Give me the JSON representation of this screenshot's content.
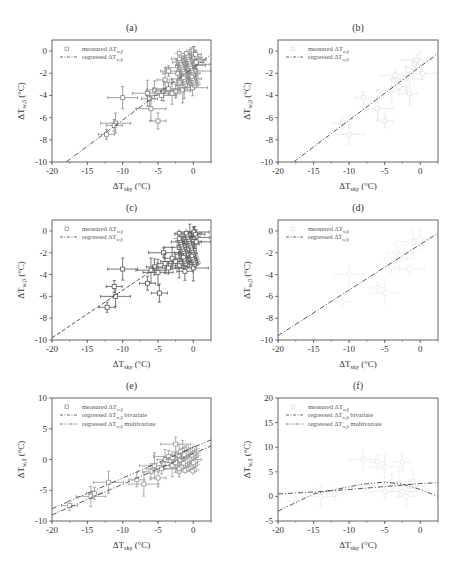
{
  "figure": {
    "panels": [
      "a",
      "b",
      "c",
      "d",
      "e",
      "f"
    ]
  },
  "chart_data": [
    {
      "id": "a",
      "title": "(a)",
      "type": "scatter",
      "xlabel": "ΔT_sky (°C)",
      "ylabel": "ΔT_w,β (°C)",
      "xlim": [
        -20,
        2.5
      ],
      "ylim": [
        -10,
        1
      ],
      "xticks": [
        -20,
        -15,
        -10,
        -5,
        0
      ],
      "yticks": [
        0,
        -2,
        -4,
        -6,
        -8,
        -10
      ],
      "legend": [
        "measured ΔT_w,β",
        "regressed ΔT_w,β"
      ],
      "legend_position": "upper-left",
      "points_visible": true,
      "point_color": "#888888",
      "points": [
        [
          -12.3,
          -7.5
        ],
        [
          -11,
          -6.5
        ],
        [
          -11.2,
          -6.7
        ],
        [
          -10,
          -4.2
        ],
        [
          -6.2,
          -4.3
        ],
        [
          -6,
          -5.2
        ],
        [
          -5,
          -6.3
        ],
        [
          -6.5,
          -3.8
        ],
        [
          -5.5,
          -3.5
        ],
        [
          -4.5,
          -4
        ],
        [
          -4.2,
          -3.6
        ],
        [
          -3.5,
          -3.4
        ],
        [
          -3,
          -3.8
        ],
        [
          -2.5,
          -3.6
        ],
        [
          -4,
          -2.6
        ],
        [
          -2,
          -2.8
        ],
        [
          -1.5,
          -3.5
        ],
        [
          -1,
          -2.5
        ],
        [
          -0.5,
          -2.2
        ],
        [
          -1.8,
          -1.5
        ],
        [
          -1.2,
          -1.2
        ],
        [
          -0.8,
          -1
        ],
        [
          -0.5,
          -0.5
        ],
        [
          -0.3,
          -0.8
        ],
        [
          0,
          -0.3
        ],
        [
          0.2,
          -1.2
        ],
        [
          -0.2,
          -2
        ],
        [
          0.3,
          -1.8
        ],
        [
          -0.6,
          -1.6
        ],
        [
          -1,
          -0.7
        ],
        [
          0.1,
          -0.6
        ],
        [
          -0.4,
          -1.3
        ],
        [
          0.4,
          -1
        ],
        [
          -0.1,
          -3.3
        ],
        [
          -1.3,
          -3.1
        ],
        [
          -2.2,
          -2
        ],
        [
          -3.5,
          -1.8
        ]
      ],
      "regression": {
        "style": "dash-dot",
        "x": [
          -18,
          2.5
        ],
        "y": [
          -10,
          -0.3
        ]
      }
    },
    {
      "id": "b",
      "title": "(b)",
      "type": "scatter",
      "xlabel": "ΔT_sky (°C)",
      "ylabel": "ΔT_w,β (°C)",
      "xlim": [
        -20,
        2.5
      ],
      "ylim": [
        -10,
        1
      ],
      "xticks": [
        -20,
        -15,
        -10,
        -5,
        0
      ],
      "yticks": [
        0,
        -2,
        -4,
        -6,
        -8,
        -10
      ],
      "legend": [
        "measured ΔT_w,β",
        "regressed ΔT_w,β"
      ],
      "legend_position": "upper-left",
      "points_visible": true,
      "point_color": "#e6e6e6",
      "points": [
        [
          -11,
          -6.5
        ],
        [
          -10,
          -7.5
        ],
        [
          -8,
          -4.2
        ],
        [
          -6,
          -5.2
        ],
        [
          -5,
          -6.3
        ],
        [
          -4,
          -3.5
        ],
        [
          -3,
          -3.2
        ],
        [
          -2,
          -2.5
        ],
        [
          -1,
          -1.5
        ],
        [
          -0.5,
          -0.8
        ],
        [
          0,
          -1
        ],
        [
          0.3,
          -2
        ],
        [
          -1.5,
          -3.8
        ],
        [
          -3.5,
          -2.2
        ]
      ],
      "regression": {
        "style": "dash-dot",
        "x": [
          -17.8,
          2.5
        ],
        "y": [
          -10,
          -0.2
        ]
      }
    },
    {
      "id": "c",
      "title": "(c)",
      "type": "scatter",
      "xlabel": "ΔT_sky (°C)",
      "ylabel": "ΔT_w,β (°C)",
      "xlim": [
        -20,
        2.5
      ],
      "ylim": [
        -10,
        1
      ],
      "xticks": [
        -20,
        -15,
        -10,
        -5,
        0
      ],
      "yticks": [
        0,
        -2,
        -4,
        -6,
        -8,
        -10
      ],
      "legend": [
        "measured ΔT_w,β",
        "regressed ΔT_w,β"
      ],
      "legend_position": "upper-left",
      "points_visible": true,
      "point_color": "#555555",
      "points": [
        [
          -12.2,
          -7
        ],
        [
          -11,
          -6
        ],
        [
          -11.2,
          -5.1
        ],
        [
          -10,
          -3.5
        ],
        [
          -6.5,
          -4.8
        ],
        [
          -6,
          -3.6
        ],
        [
          -5.5,
          -3.3
        ],
        [
          -5,
          -3.8
        ],
        [
          -4.8,
          -5.7
        ],
        [
          -4.2,
          -2
        ],
        [
          -4,
          -3
        ],
        [
          -3.5,
          -3.4
        ],
        [
          -3,
          -2.5
        ],
        [
          -2.5,
          -2.8
        ],
        [
          -2,
          -3.2
        ],
        [
          -2,
          -1.5
        ],
        [
          -1.5,
          -2
        ],
        [
          -1,
          -1
        ],
        [
          -0.8,
          -0.5
        ],
        [
          -0.5,
          -0.3
        ],
        [
          0,
          -0.2
        ],
        [
          0.2,
          -0.6
        ],
        [
          -0.3,
          -1.2
        ],
        [
          0.4,
          -1
        ],
        [
          -0.6,
          -2.6
        ],
        [
          0,
          -3.4
        ],
        [
          -1.2,
          -3.7
        ],
        [
          0.1,
          -0.1
        ]
      ],
      "regression": {
        "style": "dashed",
        "x": [
          -20,
          -6
        ],
        "y": [
          -9.8,
          -3.7
        ]
      }
    },
    {
      "id": "d",
      "title": "(d)",
      "type": "scatter",
      "xlabel": "ΔT_sky (°C)",
      "ylabel": "ΔT_w,β (°C)",
      "xlim": [
        -20,
        2.5
      ],
      "ylim": [
        -10,
        1
      ],
      "xticks": [
        -20,
        -15,
        -10,
        -5,
        0
      ],
      "yticks": [
        0,
        -2,
        -4,
        -6,
        -8,
        -10
      ],
      "legend": [
        "measured ΔT_w,β",
        "regressed ΔT_w,β"
      ],
      "legend_position": "upper-left",
      "points_visible": true,
      "point_color": "#efefef",
      "points": [
        [
          -11,
          -6.5
        ],
        [
          -10,
          -4
        ],
        [
          -6,
          -5.2
        ],
        [
          -5,
          -5.7
        ],
        [
          -4,
          -3.3
        ],
        [
          -3,
          -2.5
        ],
        [
          -2,
          -2
        ],
        [
          -1,
          -1
        ],
        [
          0,
          -0.8
        ],
        [
          -1.5,
          -3.5
        ],
        [
          -3.5,
          -2
        ]
      ],
      "regression": {
        "style": "dash-dot",
        "x": [
          -20,
          2.5
        ],
        "y": [
          -9.6,
          -0.2
        ]
      }
    },
    {
      "id": "e",
      "title": "(e)",
      "type": "scatter",
      "xlabel": "ΔT_sky (°C)",
      "ylabel": "ΔT_w,β (°C)",
      "xlim": [
        -20,
        2.5
      ],
      "ylim": [
        -10,
        10
      ],
      "xticks": [
        -20,
        -15,
        -10,
        -5,
        0
      ],
      "yticks": [
        10,
        5,
        0,
        -5,
        -10
      ],
      "legend": [
        "measured ΔT_w,β",
        "regressed ΔT_w,β bivariate",
        "regressed ΔT_w,β multivariate"
      ],
      "legend_position": "upper-left",
      "points_visible": true,
      "point_color": "#999999",
      "points": [
        [
          -17.5,
          -7.5
        ],
        [
          -14.5,
          -6
        ],
        [
          -14,
          -5.5
        ],
        [
          -12,
          -3.7
        ],
        [
          -8,
          -3.3
        ],
        [
          -7,
          -4
        ],
        [
          -6,
          -2
        ],
        [
          -5.5,
          -1
        ],
        [
          -5,
          -3
        ],
        [
          -4.5,
          -1.5
        ],
        [
          -4,
          0
        ],
        [
          -3.5,
          0.5
        ],
        [
          -3,
          -1
        ],
        [
          -2.5,
          2.5
        ],
        [
          -2,
          0.5
        ],
        [
          -2,
          -1.5
        ],
        [
          -1.5,
          1
        ],
        [
          -1,
          0
        ],
        [
          -0.5,
          0.5
        ],
        [
          -2.5,
          -0.5
        ],
        [
          -3,
          0.3
        ]
      ],
      "regression_bivariate": {
        "style": "dash-dot",
        "x": [
          -20,
          2.5
        ],
        "y": [
          -9,
          2.2
        ]
      },
      "regression_multivariate": {
        "style": "dash-dot-dot",
        "x": [
          -20,
          2.5
        ],
        "y": [
          -8,
          3.2
        ]
      }
    },
    {
      "id": "f",
      "title": "(f)",
      "type": "scatter",
      "xlabel": "ΔT_sky (°C)",
      "ylabel": "ΔT_w,β (°C)",
      "xlim": [
        -20,
        2.5
      ],
      "ylim": [
        -5,
        20
      ],
      "xticks": [
        -20,
        -15,
        -10,
        -5,
        0
      ],
      "yticks": [
        20,
        15,
        10,
        5,
        0,
        -5
      ],
      "legend": [
        "measured ΔT_w,β",
        "regressed ΔT_w,β bivariate",
        "regressed ΔT_w,β multivariate"
      ],
      "legend_position": "upper-left",
      "points_visible": true,
      "point_color": "#ececec",
      "points": [
        [
          -17.5,
          -1
        ],
        [
          -14,
          0
        ],
        [
          -12,
          0.5
        ],
        [
          -8,
          7.5
        ],
        [
          -6,
          7
        ],
        [
          -5,
          6
        ],
        [
          -4,
          3
        ],
        [
          -3,
          2.5
        ],
        [
          -2.5,
          7
        ],
        [
          -2.5,
          1
        ],
        [
          -2,
          0
        ],
        [
          -1.5,
          2
        ],
        [
          -1,
          3
        ],
        [
          -5,
          1
        ]
      ],
      "regression_bivariate": {
        "style": "dash-dot",
        "x": [
          -20,
          -15,
          -10,
          -5,
          -2.5,
          0,
          2.5
        ],
        "y": [
          0.5,
          0.9,
          1.4,
          2.0,
          2.3,
          2.6,
          2.8
        ]
      },
      "regression_multivariate": {
        "style": "dash-dot-dot",
        "x": [
          -20,
          -15,
          -12,
          -8,
          -5,
          -2.5,
          0,
          2.5
        ],
        "y": [
          -3,
          0.5,
          1.4,
          2.5,
          2.9,
          2.5,
          1.4,
          0
        ]
      }
    }
  ],
  "labels": {
    "a": "(a)",
    "b": "(b)",
    "c": "(c)",
    "d": "(d)",
    "e": "(e)",
    "f": "(f)",
    "xlabel_main": "ΔT",
    "xlabel_sub": "sky",
    "xlabel_unit": " (°C)",
    "ylabel_main": "ΔT",
    "ylabel_sub": "w,β",
    "ylabel_unit": " (°C)",
    "legend_measured": "measured ΔT",
    "legend_regressed": "regressed ΔT",
    "legend_sub": "w,β",
    "legend_bivariate": " bivariate",
    "legend_multivariate": " multivariate"
  }
}
